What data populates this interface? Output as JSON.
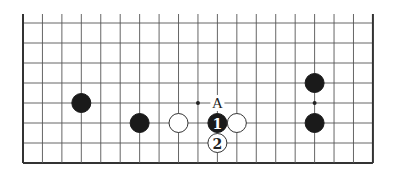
{
  "board": {
    "columns": 19,
    "rows": 8,
    "origin_x": 23,
    "origin_y": 23,
    "step_x": 19.44,
    "step_y": 20,
    "line_top_extension": 9,
    "edges": [
      "left",
      "right",
      "bottom"
    ],
    "stone_radius": 9.5
  },
  "stones": [
    {
      "color": "black",
      "col": 3,
      "row": 4,
      "label": ""
    },
    {
      "color": "black",
      "col": 6,
      "row": 5,
      "label": ""
    },
    {
      "color": "white",
      "col": 8,
      "row": 5,
      "label": ""
    },
    {
      "color": "black",
      "col": 10,
      "row": 5,
      "label": "1"
    },
    {
      "color": "white",
      "col": 11,
      "row": 5,
      "label": ""
    },
    {
      "color": "white",
      "col": 10,
      "row": 6,
      "label": "2"
    },
    {
      "color": "black",
      "col": 15,
      "row": 3,
      "label": ""
    },
    {
      "color": "black",
      "col": 15,
      "row": 5,
      "label": ""
    }
  ],
  "dots": [
    {
      "col": 9,
      "row": 4
    },
    {
      "col": 15,
      "row": 4
    }
  ],
  "point_labels": [
    {
      "col": 10,
      "row": 4,
      "text": "A"
    }
  ],
  "colors": {
    "black_stone": "#1a1a1a",
    "white_stone": "#ffffff",
    "grid": "#555555"
  }
}
